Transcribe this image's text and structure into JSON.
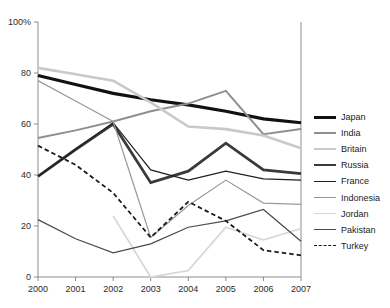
{
  "chart_data": {
    "type": "line",
    "title": "",
    "xlabel": "",
    "ylabel": "",
    "x": [
      2000,
      2001,
      2002,
      2003,
      2004,
      2005,
      2006,
      2007
    ],
    "categories": [
      "2000",
      "2001",
      "2002",
      "2003",
      "2004",
      "2005",
      "2006",
      "2007"
    ],
    "ylim": [
      0,
      100
    ],
    "xlim": [
      2000,
      2007
    ],
    "y_ticks": [
      0,
      20,
      40,
      60,
      80,
      100
    ],
    "y_tick_labels": [
      "0",
      "20",
      "40",
      "60",
      "80",
      "100%"
    ],
    "grid": false,
    "legend_position": "right",
    "series": [
      {
        "name": "Japan",
        "color": "#111111",
        "width": 3.2,
        "dashed": false,
        "values": [
          79,
          75.5,
          72,
          69.5,
          67.5,
          65,
          62,
          60.5
        ]
      },
      {
        "name": "India",
        "color": "#8f8f8f",
        "width": 2.0,
        "dashed": false,
        "values": [
          54.5,
          57.5,
          61,
          65,
          68,
          73,
          56,
          58
        ]
      },
      {
        "name": "Britain",
        "color": "#c9c9c9",
        "width": 2.6,
        "dashed": false,
        "values": [
          82,
          79.5,
          77,
          68.5,
          59,
          58,
          55.5,
          50.5
        ]
      },
      {
        "name": "Russia",
        "color": "#3a3a3a",
        "width": 2.8,
        "dashed": false,
        "values": [
          39.5,
          50,
          60,
          37,
          41.5,
          52.5,
          42,
          40.5
        ]
      },
      {
        "name": "France",
        "color": "#1f1f1f",
        "width": 1.2,
        "dashed": false,
        "values": [
          39.5,
          50,
          60.5,
          42,
          38,
          41.5,
          38.5,
          38
        ]
      },
      {
        "name": "Indonesia",
        "color": "#989898",
        "width": 1.2,
        "dashed": false,
        "values": [
          77,
          69,
          61,
          15.5,
          28,
          38,
          29,
          28.5
        ]
      },
      {
        "name": "Jordan",
        "color": "#d5d5d5",
        "width": 1.6,
        "dashed": false,
        "values": [
          null,
          null,
          24,
          0,
          2.5,
          19.5,
          14.5,
          19
        ]
      },
      {
        "name": "Pakistan",
        "color": "#4a4a4a",
        "width": 1.2,
        "dashed": false,
        "values": [
          22.5,
          15,
          9.5,
          13,
          19.5,
          22,
          26.5,
          14
        ]
      },
      {
        "name": "Turkey",
        "color": "#1a1a1a",
        "width": 1.8,
        "dashed": true,
        "values": [
          51.5,
          44,
          33,
          15.5,
          29.5,
          22,
          10.5,
          8.5
        ]
      }
    ]
  },
  "legend": {
    "items": [
      {
        "label": "Japan"
      },
      {
        "label": "India"
      },
      {
        "label": "Britain"
      },
      {
        "label": "Russia"
      },
      {
        "label": "France"
      },
      {
        "label": "Indonesia"
      },
      {
        "label": "Jordan"
      },
      {
        "label": "Pakistan"
      },
      {
        "label": "Turkey"
      }
    ]
  }
}
